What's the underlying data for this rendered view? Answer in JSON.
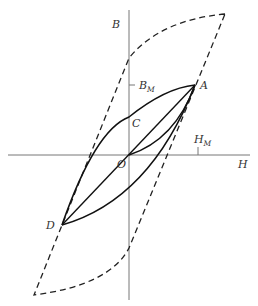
{
  "diagram": {
    "type": "hysteresis-loop",
    "axes": {
      "horizontal_label": "H",
      "vertical_label": "B",
      "origin_label": "O"
    },
    "points": {
      "A": "A",
      "C": "C",
      "D": "D"
    },
    "ticks": {
      "bm_main": "B",
      "bm_sub": "M",
      "hm_main": "H",
      "hm_sub": "M"
    },
    "colors": {
      "line": "#1a1a1a",
      "axis": "#666666",
      "text": "#333333"
    }
  }
}
